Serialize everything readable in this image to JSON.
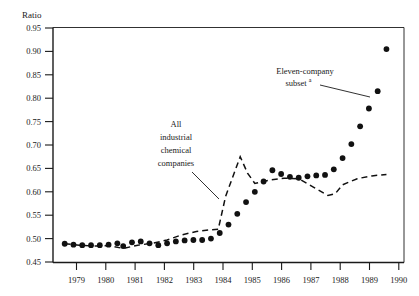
{
  "chart_data": {
    "type": "line",
    "title": "",
    "subtitle": "",
    "xlabel": "",
    "ylabel": "Ratio",
    "ylabel_position": "top-left",
    "xlim": [
      1978.6,
      1990.6
    ],
    "ylim": [
      0.45,
      0.95
    ],
    "ytick_step": 0.05,
    "grid": false,
    "legend": "inline-annotations",
    "x_ticks": [
      1979,
      1980,
      1981,
      1982,
      1983,
      1984,
      1985,
      1986,
      1987,
      1988,
      1989,
      1990
    ],
    "x_tick_labels": [
      "1979",
      "1980",
      "1981",
      "1982",
      "1983",
      "1984",
      "1985",
      "1986",
      "1987",
      "1988",
      "1989",
      "1990"
    ],
    "y_ticks": [
      0.45,
      0.5,
      0.55,
      0.6,
      0.65,
      0.7,
      0.75,
      0.8,
      0.85,
      0.9,
      0.95
    ],
    "y_tick_labels": [
      "0.45",
      "0.50",
      "0.55",
      "0.60",
      "0.65",
      "0.70",
      "0.75",
      "0.80",
      "0.85",
      "0.90",
      "0.95"
    ],
    "series": [
      {
        "name": "All industrial chemical companies",
        "style": "dashed-line",
        "color": "#111111",
        "x": [
          1979.0,
          1979.5,
          1980.0,
          1980.5,
          1981.0,
          1981.5,
          1982.0,
          1982.5,
          1983.0,
          1983.5,
          1984.0,
          1984.25,
          1984.5,
          1985.0,
          1985.25,
          1985.5,
          1986.0,
          1986.5,
          1987.0,
          1987.5,
          1988.0,
          1988.25,
          1988.5,
          1989.0,
          1989.5,
          1990.0
        ],
        "values": [
          0.489,
          0.486,
          0.484,
          0.485,
          0.479,
          0.486,
          0.49,
          0.497,
          0.508,
          0.515,
          0.519,
          0.52,
          0.59,
          0.675,
          0.64,
          0.618,
          0.625,
          0.629,
          0.628,
          0.61,
          0.592,
          0.596,
          0.615,
          0.628,
          0.634,
          0.637
        ]
      },
      {
        "name": "Eleven-company subset",
        "style": "dotted-markers",
        "color": "#111111",
        "x": [
          1979.0,
          1979.3,
          1979.6,
          1979.9,
          1980.2,
          1980.5,
          1980.8,
          1981.0,
          1981.3,
          1981.6,
          1981.9,
          1982.2,
          1982.5,
          1982.8,
          1983.1,
          1983.4,
          1983.7,
          1984.0,
          1984.3,
          1984.6,
          1984.9,
          1985.2,
          1985.5,
          1985.8,
          1986.1,
          1986.4,
          1986.7,
          1987.0,
          1987.3,
          1987.6,
          1987.9,
          1988.2,
          1988.5,
          1988.8,
          1989.1,
          1989.4,
          1989.7,
          1990.0
        ],
        "values": [
          0.489,
          0.487,
          0.486,
          0.486,
          0.486,
          0.487,
          0.49,
          0.484,
          0.492,
          0.494,
          0.49,
          0.486,
          0.49,
          0.494,
          0.496,
          0.497,
          0.497,
          0.5,
          0.512,
          0.53,
          0.553,
          0.578,
          0.6,
          0.622,
          0.646,
          0.638,
          0.632,
          0.63,
          0.633,
          0.635,
          0.636,
          0.648,
          0.672,
          0.702,
          0.74,
          0.778,
          0.815,
          0.905
        ]
      }
    ],
    "annotations": [
      {
        "id": "annotation-all-industrial",
        "lines": [
          "All",
          "industrial",
          "chemical",
          "companies"
        ],
        "text": "All industrial chemical companies",
        "target_series": "All industrial chemical companies"
      },
      {
        "id": "annotation-eleven-company",
        "lines": [
          "Eleven-company",
          "subset"
        ],
        "text": "Eleven-company subset",
        "footnote_marker": "a",
        "target_series": "Eleven-company subset"
      }
    ]
  },
  "axis": {
    "y_title": "Ratio"
  },
  "annotations": {
    "all_industrial": {
      "line1": "All",
      "line2": "industrial",
      "line3": "chemical",
      "line4": "companies"
    },
    "eleven_company": {
      "line1": "Eleven-company",
      "line2": "subset",
      "marker": "a"
    }
  },
  "colors": {
    "ink": "#111111",
    "background": "#ffffff"
  }
}
